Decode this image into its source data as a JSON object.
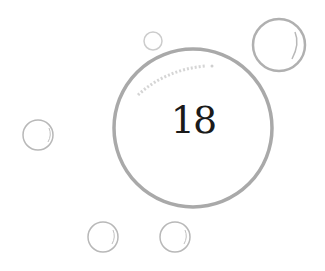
{
  "badge": {
    "number": "18"
  },
  "colors": {
    "ring": "#a8a8a8",
    "bubble": "#b8b8b8",
    "text": "#1a1a1a",
    "background": "#ffffff"
  },
  "icons": {
    "main": "bubble-ring",
    "decor": "small-bubble"
  }
}
